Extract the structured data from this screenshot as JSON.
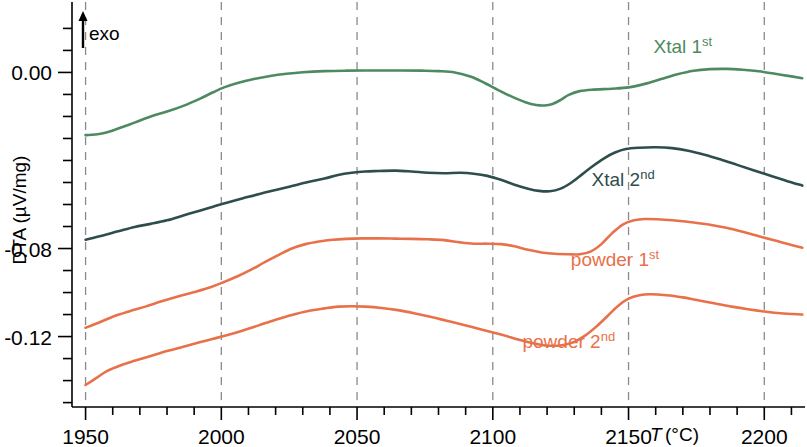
{
  "chart_data": {
    "type": "line",
    "title": "",
    "xlabel": "T (°C)",
    "ylabel": "DTA (µV/mg)",
    "xlim": [
      1945,
      2215
    ],
    "ylim": [
      -0.152,
      0.032
    ],
    "xticks_major": [
      1950,
      2000,
      2050,
      2100,
      2150,
      2200
    ],
    "xticklabels": [
      "1950",
      "2000",
      "2050",
      "2100",
      "2150",
      "2200"
    ],
    "yticks_labeled": [
      0.0,
      -0.08,
      -0.12
    ],
    "yticklabels": [
      "0.00",
      "-0.08",
      "-0.12"
    ],
    "ytick_step_minor": 0.01,
    "grid": "vertical dashed at major x ticks",
    "legend_position": "inline annotations at right of each curve",
    "annotation_exo": "exo",
    "annotation_exo_arrow": "up-arrow",
    "series": [
      {
        "name": "Xtal 1st",
        "label_main": "Xtal 1",
        "label_sup": "st",
        "color": "#4e8a61",
        "label_x": 2170,
        "label_y": 0.009,
        "points_xy": [
          [
            1950,
            -0.0285
          ],
          [
            1955,
            -0.028
          ],
          [
            1958,
            -0.0272
          ],
          [
            1962,
            -0.0255
          ],
          [
            1968,
            -0.0228
          ],
          [
            1974,
            -0.02
          ],
          [
            1980,
            -0.0178
          ],
          [
            1986,
            -0.0152
          ],
          [
            1992,
            -0.012
          ],
          [
            1997,
            -0.009
          ],
          [
            2001,
            -0.0068
          ],
          [
            2006,
            -0.0048
          ],
          [
            2012,
            -0.003
          ],
          [
            2018,
            -0.0016
          ],
          [
            2024,
            -0.0006
          ],
          [
            2030,
            0.0001
          ],
          [
            2038,
            0.0006
          ],
          [
            2046,
            0.0008
          ],
          [
            2056,
            0.0009
          ],
          [
            2066,
            0.0009
          ],
          [
            2074,
            0.0008
          ],
          [
            2080,
            0.0006
          ],
          [
            2086,
            0.0
          ],
          [
            2092,
            -0.002
          ],
          [
            2097,
            -0.0048
          ],
          [
            2102,
            -0.008
          ],
          [
            2107,
            -0.011
          ],
          [
            2112,
            -0.0135
          ],
          [
            2116,
            -0.0148
          ],
          [
            2119,
            -0.015
          ],
          [
            2122,
            -0.0143
          ],
          [
            2125,
            -0.0125
          ],
          [
            2128,
            -0.0102
          ],
          [
            2132,
            -0.0085
          ],
          [
            2137,
            -0.0078
          ],
          [
            2144,
            -0.0074
          ],
          [
            2150,
            -0.0068
          ],
          [
            2156,
            -0.0052
          ],
          [
            2162,
            -0.003
          ],
          [
            2168,
            -0.0008
          ],
          [
            2174,
            0.0008
          ],
          [
            2180,
            0.0015
          ],
          [
            2186,
            0.0016
          ],
          [
            2192,
            0.0012
          ],
          [
            2198,
            0.0005
          ],
          [
            2204,
            -0.0006
          ],
          [
            2210,
            -0.0018
          ],
          [
            2214,
            -0.0026
          ]
        ]
      },
      {
        "name": "Xtal 2nd",
        "label_main": "Xtal 2",
        "label_sup": "nd",
        "color": "#2e4d4d",
        "label_x": 2148,
        "label_y": -0.0515,
        "points_xy": [
          [
            1950,
            -0.076
          ],
          [
            1956,
            -0.0742
          ],
          [
            1962,
            -0.0722
          ],
          [
            1968,
            -0.0702
          ],
          [
            1974,
            -0.0688
          ],
          [
            1980,
            -0.0672
          ],
          [
            1986,
            -0.065
          ],
          [
            1992,
            -0.0628
          ],
          [
            1997,
            -0.061
          ],
          [
            2002,
            -0.0592
          ],
          [
            2008,
            -0.0572
          ],
          [
            2014,
            -0.0552
          ],
          [
            2020,
            -0.0534
          ],
          [
            2026,
            -0.0516
          ],
          [
            2032,
            -0.0498
          ],
          [
            2038,
            -0.0482
          ],
          [
            2043,
            -0.0466
          ],
          [
            2048,
            -0.0456
          ],
          [
            2053,
            -0.045
          ],
          [
            2058,
            -0.0448
          ],
          [
            2064,
            -0.0446
          ],
          [
            2070,
            -0.045
          ],
          [
            2076,
            -0.0456
          ],
          [
            2082,
            -0.0458
          ],
          [
            2088,
            -0.0456
          ],
          [
            2093,
            -0.046
          ],
          [
            2098,
            -0.047
          ],
          [
            2103,
            -0.0488
          ],
          [
            2108,
            -0.051
          ],
          [
            2113,
            -0.0528
          ],
          [
            2117,
            -0.0538
          ],
          [
            2121,
            -0.054
          ],
          [
            2125,
            -0.0528
          ],
          [
            2129,
            -0.05
          ],
          [
            2133,
            -0.0462
          ],
          [
            2137,
            -0.0424
          ],
          [
            2141,
            -0.039
          ],
          [
            2145,
            -0.0364
          ],
          [
            2149,
            -0.0348
          ],
          [
            2154,
            -0.0342
          ],
          [
            2160,
            -0.034
          ],
          [
            2166,
            -0.0344
          ],
          [
            2172,
            -0.0356
          ],
          [
            2178,
            -0.0374
          ],
          [
            2184,
            -0.0396
          ],
          [
            2190,
            -0.042
          ],
          [
            2196,
            -0.0444
          ],
          [
            2202,
            -0.0468
          ],
          [
            2208,
            -0.0492
          ],
          [
            2214,
            -0.0514
          ]
        ]
      },
      {
        "name": "powder 1st",
        "label_main": "powder 1",
        "label_sup": "st",
        "color": "#e8714a",
        "label_x": 2145,
        "label_y": -0.088,
        "points_xy": [
          [
            1950,
            -0.116
          ],
          [
            1955,
            -0.1136
          ],
          [
            1960,
            -0.111
          ],
          [
            1966,
            -0.1086
          ],
          [
            1972,
            -0.1064
          ],
          [
            1978,
            -0.104
          ],
          [
            1984,
            -0.1018
          ],
          [
            1990,
            -0.0998
          ],
          [
            1996,
            -0.0976
          ],
          [
            2001,
            -0.0952
          ],
          [
            2006,
            -0.0926
          ],
          [
            2011,
            -0.0896
          ],
          [
            2016,
            -0.0862
          ],
          [
            2021,
            -0.083
          ],
          [
            2026,
            -0.08
          ],
          [
            2031,
            -0.078
          ],
          [
            2036,
            -0.0768
          ],
          [
            2041,
            -0.076
          ],
          [
            2046,
            -0.0756
          ],
          [
            2052,
            -0.0754
          ],
          [
            2058,
            -0.0754
          ],
          [
            2064,
            -0.0755
          ],
          [
            2070,
            -0.0756
          ],
          [
            2076,
            -0.0758
          ],
          [
            2082,
            -0.0762
          ],
          [
            2088,
            -0.0772
          ],
          [
            2093,
            -0.0778
          ],
          [
            2098,
            -0.0778
          ],
          [
            2103,
            -0.078
          ],
          [
            2108,
            -0.079
          ],
          [
            2113,
            -0.0806
          ],
          [
            2118,
            -0.0818
          ],
          [
            2123,
            -0.0824
          ],
          [
            2128,
            -0.0826
          ],
          [
            2132,
            -0.0826
          ],
          [
            2136,
            -0.0814
          ],
          [
            2140,
            -0.078
          ],
          [
            2144,
            -0.073
          ],
          [
            2148,
            -0.069
          ],
          [
            2152,
            -0.0672
          ],
          [
            2156,
            -0.0666
          ],
          [
            2162,
            -0.0668
          ],
          [
            2168,
            -0.0674
          ],
          [
            2174,
            -0.0682
          ],
          [
            2180,
            -0.0692
          ],
          [
            2186,
            -0.0706
          ],
          [
            2192,
            -0.0724
          ],
          [
            2198,
            -0.0744
          ],
          [
            2204,
            -0.0764
          ],
          [
            2210,
            -0.0784
          ],
          [
            2214,
            -0.0796
          ]
        ]
      },
      {
        "name": "powder 2nd",
        "label_main": "powder 2",
        "label_sup": "nd",
        "color": "#e8714a",
        "label_x": 2128,
        "label_y": -0.125,
        "points_xy": [
          [
            1950,
            -0.142
          ],
          [
            1954,
            -0.1388
          ],
          [
            1958,
            -0.1356
          ],
          [
            1963,
            -0.133
          ],
          [
            1968,
            -0.131
          ],
          [
            1974,
            -0.1288
          ],
          [
            1980,
            -0.1266
          ],
          [
            1986,
            -0.1246
          ],
          [
            1992,
            -0.1226
          ],
          [
            1997,
            -0.121
          ],
          [
            2002,
            -0.1194
          ],
          [
            2008,
            -0.1172
          ],
          [
            2014,
            -0.1148
          ],
          [
            2020,
            -0.1124
          ],
          [
            2026,
            -0.1102
          ],
          [
            2032,
            -0.1084
          ],
          [
            2038,
            -0.1072
          ],
          [
            2043,
            -0.1064
          ],
          [
            2048,
            -0.1062
          ],
          [
            2053,
            -0.1064
          ],
          [
            2059,
            -0.107
          ],
          [
            2065,
            -0.108
          ],
          [
            2071,
            -0.1094
          ],
          [
            2077,
            -0.111
          ],
          [
            2083,
            -0.1128
          ],
          [
            2089,
            -0.1146
          ],
          [
            2094,
            -0.1162
          ],
          [
            2099,
            -0.1178
          ],
          [
            2104,
            -0.1194
          ],
          [
            2109,
            -0.1212
          ],
          [
            2114,
            -0.1228
          ],
          [
            2118,
            -0.1238
          ],
          [
            2122,
            -0.1242
          ],
          [
            2126,
            -0.1238
          ],
          [
            2130,
            -0.1224
          ],
          [
            2134,
            -0.1196
          ],
          [
            2138,
            -0.1156
          ],
          [
            2142,
            -0.111
          ],
          [
            2146,
            -0.1062
          ],
          [
            2150,
            -0.1028
          ],
          [
            2154,
            -0.1012
          ],
          [
            2158,
            -0.1008
          ],
          [
            2164,
            -0.1012
          ],
          [
            2170,
            -0.1022
          ],
          [
            2176,
            -0.1036
          ],
          [
            2182,
            -0.105
          ],
          [
            2188,
            -0.1064
          ],
          [
            2194,
            -0.1076
          ],
          [
            2200,
            -0.1086
          ],
          [
            2206,
            -0.1094
          ],
          [
            2214,
            -0.11
          ]
        ]
      }
    ]
  },
  "axes": {
    "y_title": "DTA (µV/mg)",
    "x_title_italic": "T",
    "x_title_unit": "(°C)",
    "exo_text": "exo"
  }
}
